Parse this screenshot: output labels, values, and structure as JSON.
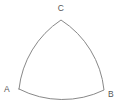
{
  "figure": {
    "type": "reuleaux-triangle",
    "background_color": "#ffffff",
    "stroke_color": "#888888",
    "stroke_width": 1,
    "label_color": "#555555",
    "label_font_size": 8.5,
    "arc_radius": 95,
    "vertices": [
      {
        "label": "A",
        "x": 19,
        "y": 89,
        "label_x": 7,
        "label_y": 92
      },
      {
        "label": "B",
        "x": 104,
        "y": 90,
        "label_x": 111,
        "label_y": 96.5
      },
      {
        "label": "C",
        "x": 61,
        "y": 20,
        "label_x": 61,
        "label_y": 11
      }
    ]
  }
}
